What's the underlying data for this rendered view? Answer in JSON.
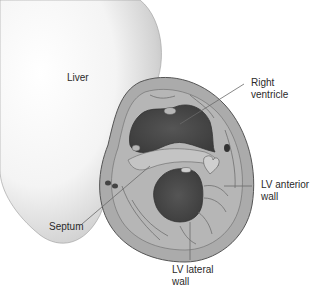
{
  "diagram": {
    "labels": {
      "liver": "Liver",
      "right_ventricle_line1": "Right",
      "right_ventricle_line2": "ventricle",
      "lv_anterior_line1": "LV anterior",
      "lv_anterior_line2": "wall",
      "septum": "Septum",
      "lv_lateral_line1": "LV lateral",
      "lv_lateral_line2": "wall"
    },
    "colors": {
      "background": "#ffffff",
      "liver_shade": "#cfcfcf",
      "myocardium": "#a9a9a9",
      "myocardium_light": "#bdbdbd",
      "cavity": "#4a4a4a",
      "outline": "#5a5a5a",
      "leader_line": "#6a6a6a",
      "text": "#2a2a2a"
    }
  }
}
